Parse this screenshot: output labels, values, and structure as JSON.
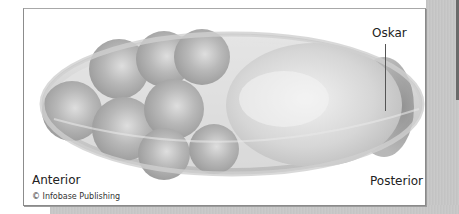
{
  "figure": {
    "labels": {
      "oskar": "Oskar",
      "anterior": "Anterior",
      "posterior": "Posterior"
    },
    "credit": "© Infobase Publishing"
  },
  "colors": {
    "panel_background": "#ffffff",
    "panel_border": "#8c8c8c",
    "shell": "#d9d9d9",
    "nurse_cell": "#b5b5b5",
    "oocyte": "#dcdcdc",
    "oskar_crescent": "#9a9a9a",
    "label_text": "#222222"
  }
}
